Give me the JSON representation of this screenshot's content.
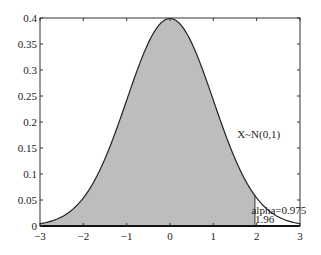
{
  "chart_data": {
    "type": "area",
    "title": "",
    "xlabel": "",
    "ylabel": "",
    "xlim": [
      -3,
      3
    ],
    "ylim": [
      0,
      0.4
    ],
    "grid": false,
    "legend": null,
    "x_ticks": [
      -3,
      -2,
      -1,
      0,
      1,
      2,
      3
    ],
    "x_tick_labels": [
      "-3",
      "-2",
      "-1",
      "0",
      "1",
      "2",
      "3"
    ],
    "y_ticks": [
      0,
      0.05,
      0.1,
      0.15,
      0.2,
      0.25,
      0.3,
      0.35,
      0.4
    ],
    "y_tick_labels": [
      "0",
      "0.05",
      "0.1",
      "0.15",
      "0.2",
      "0.25",
      "0.3",
      "0.35",
      "0.4"
    ],
    "series": [
      {
        "name": "N(0,1) pdf",
        "function": "standard normal density",
        "x": [
          -3,
          -2.5,
          -2,
          -1.5,
          -1,
          -0.5,
          0,
          0.5,
          1,
          1.5,
          1.96,
          2,
          2.5,
          3
        ],
        "values": [
          0.0044,
          0.0175,
          0.054,
          0.1295,
          0.242,
          0.3521,
          0.3989,
          0.3521,
          0.242,
          0.1295,
          0.0584,
          0.054,
          0.0175,
          0.0044
        ]
      }
    ],
    "shaded_region": {
      "from": -3,
      "to": 1.96,
      "color": "#bdbdbd"
    },
    "annotations": [
      {
        "text": "X~N(0,1)",
        "x": 1.55,
        "y": 0.17
      },
      {
        "text": "alpha=0.975",
        "x": 1.88,
        "y": 0.024
      },
      {
        "text": "1.96",
        "x": 1.96,
        "y": 0.005
      }
    ],
    "colors": {
      "fill": "#bdbdbd",
      "line": "#222222",
      "axes": "#333333"
    }
  }
}
